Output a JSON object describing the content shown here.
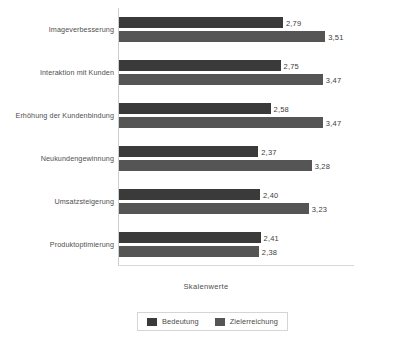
{
  "chart_data": {
    "type": "bar",
    "orientation": "horizontal",
    "title": "",
    "xlabel": "Skalenwerte",
    "ylabel": "",
    "xlim": [
      0,
      4.0
    ],
    "grid": false,
    "legend_position": "bottom",
    "value_label_format": "comma-decimal",
    "categories": [
      "Imageverbesserung",
      "Interaktion mit Kunden",
      "Erhöhung der Kundenbindung",
      "Neukundengewinnung",
      "Umsatzsteigerung",
      "Produktoptimierung"
    ],
    "series": [
      {
        "name": "Bedeutung",
        "color": "#3a3a3a",
        "values": [
          2.79,
          2.75,
          2.58,
          2.37,
          2.4,
          2.41
        ],
        "labels": [
          "2,79",
          "2,75",
          "2,58",
          "2,37",
          "2,40",
          "2,41"
        ]
      },
      {
        "name": "Zielerreichung",
        "color": "#555555",
        "values": [
          3.51,
          3.47,
          3.47,
          3.28,
          3.23,
          2.38
        ],
        "labels": [
          "3,51",
          "3,47",
          "3,47",
          "3,28",
          "3,23",
          "2,38"
        ]
      }
    ]
  },
  "axis_title": "Skalenwerte",
  "legend": {
    "items": [
      {
        "label": "Bedeutung"
      },
      {
        "label": "Zielerreichung"
      }
    ]
  }
}
